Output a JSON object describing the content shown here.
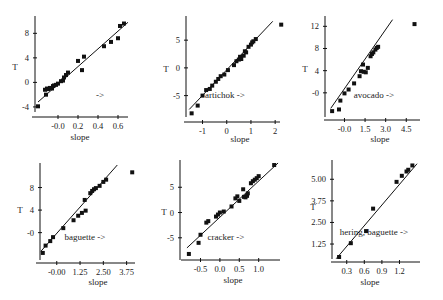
{
  "chart_data": [
    {
      "type": "scatter",
      "panel": 1,
      "title": "",
      "annotation": "->",
      "xlabel": "slope",
      "ylabel": "T",
      "xticks": [
        "-0.0",
        "0.2",
        "0.4",
        "0.6"
      ],
      "yticks": [
        "-4",
        "0",
        "4",
        "8"
      ],
      "xlim": [
        -0.22,
        0.7
      ],
      "ylim": [
        -4.5,
        10.5
      ],
      "fit_line": {
        "x": [
          -0.2,
          0.7
        ],
        "y": [
          -3.2,
          9.8
        ]
      },
      "points": [
        [
          -0.2,
          -3.9
        ],
        [
          -0.13,
          -1.2
        ],
        [
          -0.12,
          -2.0
        ],
        [
          -0.11,
          -1.0
        ],
        [
          -0.1,
          -1.1
        ],
        [
          -0.08,
          -0.9
        ],
        [
          -0.06,
          -1.0
        ],
        [
          -0.05,
          -0.6
        ],
        [
          -0.04,
          -0.5
        ],
        [
          -0.02,
          -0.4
        ],
        [
          0.0,
          -0.2
        ],
        [
          0.03,
          0.2
        ],
        [
          0.05,
          0.3
        ],
        [
          0.06,
          0.8
        ],
        [
          0.08,
          1.2
        ],
        [
          0.1,
          1.6
        ],
        [
          0.2,
          3.5
        ],
        [
          0.24,
          2.0
        ],
        [
          0.26,
          4.2
        ],
        [
          0.46,
          5.9
        ],
        [
          0.53,
          6.6
        ],
        [
          0.6,
          7.2
        ],
        [
          0.62,
          9.2
        ],
        [
          0.66,
          9.6
        ]
      ]
    },
    {
      "type": "scatter",
      "panel": 2,
      "title": "",
      "annotation": "artichok ->",
      "xlabel": "slope",
      "ylabel": "T",
      "xticks": [
        "-1",
        "0",
        "1",
        "2"
      ],
      "yticks": [
        "-5",
        "0",
        "5"
      ],
      "xlim": [
        -1.6,
        2.2
      ],
      "ylim": [
        -8.5,
        9.0
      ],
      "fit_line": {
        "x": [
          -1.55,
          1.9
        ],
        "y": [
          -7.5,
          8.4
        ]
      },
      "points": [
        [
          -1.45,
          -8.2
        ],
        [
          -1.2,
          -6.8
        ],
        [
          -1.0,
          -5.0
        ],
        [
          -0.85,
          -4.0
        ],
        [
          -0.7,
          -3.8
        ],
        [
          -0.6,
          -3.2
        ],
        [
          -0.45,
          -2.5
        ],
        [
          -0.35,
          -2.0
        ],
        [
          -0.25,
          -1.5
        ],
        [
          -0.1,
          -1.2
        ],
        [
          0.05,
          -0.4
        ],
        [
          0.3,
          0.5
        ],
        [
          0.4,
          1.2
        ],
        [
          0.5,
          1.5
        ],
        [
          0.55,
          2.0
        ],
        [
          0.6,
          1.6
        ],
        [
          0.7,
          2.2
        ],
        [
          0.75,
          3.0
        ],
        [
          0.8,
          2.8
        ],
        [
          0.9,
          3.8
        ],
        [
          1.0,
          4.2
        ],
        [
          1.05,
          4.6
        ],
        [
          1.1,
          4.8
        ],
        [
          1.2,
          5.2
        ],
        [
          2.25,
          7.8
        ]
      ]
    },
    {
      "type": "scatter",
      "panel": 3,
      "title": "",
      "annotation": "avocado ->",
      "xlabel": "slope",
      "ylabel": "T",
      "xticks": [
        "-0.0",
        "1.5",
        "3.0",
        "4.5"
      ],
      "yticks": [
        "-0",
        "4",
        "8",
        "12"
      ],
      "xlim": [
        -1.2,
        5.5
      ],
      "ylim": [
        -4.0,
        13.5
      ],
      "fit_line": {
        "x": [
          -1.0,
          3.5
        ],
        "y": [
          -2.8,
          13.2
        ]
      },
      "points": [
        [
          -0.9,
          -3.3
        ],
        [
          -0.4,
          -3.0
        ],
        [
          -0.3,
          -1.4
        ],
        [
          0.0,
          -0.1
        ],
        [
          0.3,
          0.6
        ],
        [
          0.7,
          1.7
        ],
        [
          1.1,
          3.0
        ],
        [
          1.2,
          3.9
        ],
        [
          1.35,
          5.1
        ],
        [
          1.4,
          3.8
        ],
        [
          1.55,
          3.7
        ],
        [
          1.7,
          4.5
        ],
        [
          1.9,
          6.6
        ],
        [
          2.0,
          7.0
        ],
        [
          2.1,
          7.3
        ],
        [
          2.25,
          7.8
        ],
        [
          2.35,
          8.1
        ],
        [
          2.45,
          8.3
        ],
        [
          5.1,
          12.4
        ]
      ]
    },
    {
      "type": "scatter",
      "panel": 4,
      "title": "",
      "annotation": "baguette ->",
      "xlabel": "slope",
      "ylabel": "T",
      "xticks": [
        "-0.00",
        "1.25",
        "2.50",
        "3.75"
      ],
      "yticks": [
        "-0",
        "4",
        "8"
      ],
      "xlim": [
        -0.9,
        4.2
      ],
      "ylim": [
        -4.5,
        12.0
      ],
      "fit_line": {
        "x": [
          -0.85,
          3.25
        ],
        "y": [
          -3.3,
          12.0
        ]
      },
      "points": [
        [
          -0.75,
          -3.6
        ],
        [
          -0.6,
          -2.3
        ],
        [
          -0.35,
          -1.5
        ],
        [
          -0.2,
          -0.8
        ],
        [
          0.35,
          0.8
        ],
        [
          0.9,
          2.2
        ],
        [
          1.15,
          3.0
        ],
        [
          1.35,
          3.5
        ],
        [
          1.5,
          5.8
        ],
        [
          1.55,
          3.9
        ],
        [
          1.8,
          7.0
        ],
        [
          1.9,
          7.4
        ],
        [
          2.0,
          7.7
        ],
        [
          2.1,
          7.9
        ],
        [
          2.3,
          8.3
        ],
        [
          2.5,
          9.0
        ],
        [
          2.65,
          9.4
        ],
        [
          4.05,
          10.7
        ]
      ]
    },
    {
      "type": "scatter",
      "panel": 5,
      "title": "",
      "annotation": "cracker ->",
      "xlabel": "slope",
      "ylabel": "T",
      "xticks": [
        "-0.5",
        "0.0",
        "0.5",
        "1.0"
      ],
      "yticks": [
        "-5",
        "0",
        "5"
      ],
      "xlim": [
        -0.9,
        1.55
      ],
      "ylim": [
        -9.0,
        10.0
      ],
      "fit_line": {
        "x": [
          -0.85,
          1.5
        ],
        "y": [
          -7.0,
          9.8
        ]
      },
      "points": [
        [
          -0.8,
          -8.2
        ],
        [
          -0.55,
          -6.0
        ],
        [
          -0.5,
          -4.4
        ],
        [
          -0.35,
          -2.0
        ],
        [
          -0.3,
          -1.7
        ],
        [
          -0.1,
          -0.8
        ],
        [
          -0.05,
          -0.4
        ],
        [
          0.0,
          0.0
        ],
        [
          0.1,
          0.2
        ],
        [
          0.3,
          1.2
        ],
        [
          0.4,
          2.8
        ],
        [
          0.45,
          3.2
        ],
        [
          0.5,
          2.3
        ],
        [
          0.6,
          4.6
        ],
        [
          0.62,
          3.1
        ],
        [
          0.66,
          3.0
        ],
        [
          0.7,
          3.3
        ],
        [
          0.72,
          3.8
        ],
        [
          0.8,
          5.8
        ],
        [
          0.85,
          6.2
        ],
        [
          0.9,
          6.5
        ],
        [
          0.95,
          6.8
        ],
        [
          1.0,
          7.2
        ],
        [
          1.4,
          9.4
        ]
      ]
    },
    {
      "type": "scatter",
      "panel": 6,
      "title": "",
      "annotation": "hering, baguette ->",
      "xlabel": "slope",
      "ylabel": "T",
      "xticks": [
        "0.3",
        "0.6",
        "0.9",
        "1.2"
      ],
      "yticks": [
        "1.25",
        "2.50",
        "3.75",
        "5.00"
      ],
      "xlim": [
        0.1,
        1.55
      ],
      "ylim": [
        0.5,
        6.0
      ],
      "fit_line": {
        "x": [
          0.12,
          1.5
        ],
        "y": [
          0.4,
          5.9
        ]
      },
      "points": [
        [
          0.17,
          0.5
        ],
        [
          0.37,
          1.3
        ],
        [
          0.63,
          2.0
        ],
        [
          0.75,
          3.3
        ],
        [
          1.15,
          4.85
        ],
        [
          1.24,
          5.2
        ],
        [
          1.32,
          5.45
        ],
        [
          1.35,
          5.55
        ],
        [
          1.42,
          5.8
        ]
      ]
    }
  ],
  "panels": [
    {
      "ylabel": "T",
      "xlabel": "slope",
      "annotation": "->"
    },
    {
      "ylabel": "T",
      "xlabel": "slope",
      "annotation": "artichok ->"
    },
    {
      "ylabel": "T",
      "xlabel": "slope",
      "annotation": "avocado ->"
    },
    {
      "ylabel": "T",
      "xlabel": "slope",
      "annotation": "baguette ->"
    },
    {
      "ylabel": "T",
      "xlabel": "slope",
      "annotation": "cracker ->"
    },
    {
      "ylabel": "T",
      "xlabel": "slope",
      "annotation": "hering, baguette ->"
    }
  ]
}
